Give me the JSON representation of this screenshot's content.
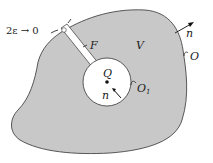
{
  "diagram": {
    "colors": {
      "region_fill": "#c8c8c8",
      "outline": "#333333",
      "background": "#ffffff"
    },
    "labels": {
      "cut_width": "2ε → 0",
      "cut": "F",
      "region": "V",
      "outer_normal": "n",
      "outer_surface": "O",
      "point": "Q",
      "inner_normal": "n",
      "inner_surface": "O",
      "inner_surface_sub": "1"
    }
  }
}
